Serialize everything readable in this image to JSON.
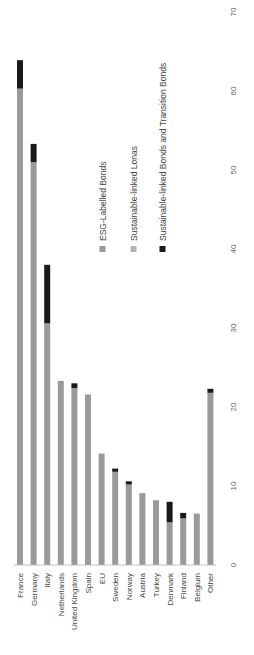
{
  "chart_data": {
    "type": "bar",
    "stacked": true,
    "orientation": "rotated-90-clockwise (vertical bars, rendered rotated so categories read bottom-to-top)",
    "title": "",
    "xlabel": "",
    "ylabel": "",
    "ylim": [
      0,
      70
    ],
    "yticks": [
      0,
      10,
      20,
      30,
      40,
      50,
      60,
      70
    ],
    "grid": false,
    "legend_position": "inside, upper right of plot (rotated)",
    "categories": [
      "France",
      "Germany",
      "Italy",
      "Netherlands",
      "United Kingdom",
      "Spain",
      "EU",
      "Sweden",
      "Norway",
      "Austria",
      "Turkey",
      "Denmark",
      "Finland",
      "Belgium",
      "Other"
    ],
    "series": [
      {
        "name": "ESG-Labelled Bonds",
        "color": "#9a9a9a",
        "values": [
          60.3,
          51.0,
          30.6,
          23.3,
          22.4,
          21.6,
          14.1,
          11.8,
          10.2,
          9.1,
          8.2,
          5.4,
          5.9,
          6.5,
          21.8
        ]
      },
      {
        "name": "Sustainable-linked Lonas",
        "color": "#b4b4b4",
        "values": [
          0,
          0,
          0,
          0,
          0,
          0,
          0,
          0,
          0,
          0,
          0,
          0,
          0,
          0,
          0
        ]
      },
      {
        "name": "Sustainable-linked Bonds and Transition Bonds",
        "color": "#1a1a1a",
        "values": [
          3.6,
          2.3,
          7.4,
          0,
          0.6,
          0,
          0,
          0.4,
          0.4,
          0,
          0,
          2.6,
          0.7,
          0,
          0.5
        ]
      }
    ]
  },
  "legend": [
    {
      "label": "ESG-Labelled Bonds",
      "color": "#9a9a9a"
    },
    {
      "label": "Sustainable-linked Lonas",
      "color": "#b4b4b4"
    },
    {
      "label": "Sustainable-linked Bonds and Transition Bonds",
      "color": "#1a1a1a"
    }
  ],
  "axis": {
    "tick_labels": [
      "0",
      "10",
      "20",
      "30",
      "40",
      "50",
      "60",
      "70"
    ]
  }
}
